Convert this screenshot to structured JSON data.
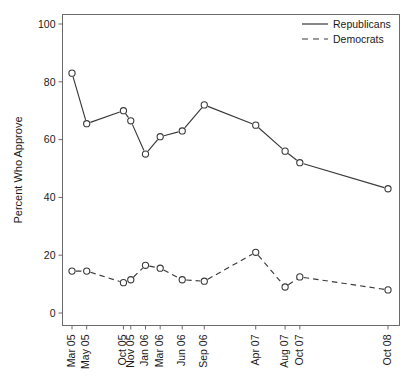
{
  "chart_data": {
    "type": "line",
    "title": "",
    "xlabel": "",
    "ylabel": "Percent Who Approve",
    "ylim": [
      0,
      100
    ],
    "yticks": [
      0,
      20,
      40,
      60,
      80,
      100
    ],
    "ytick_labels": [
      "0",
      "20",
      "40",
      "60",
      "80",
      "100"
    ],
    "grid": false,
    "legend_position": "top-right",
    "categories": [
      "Mar 05",
      "May 05",
      "Oct 05",
      "Nov 05",
      "Jan 06",
      "Mar 06",
      "Jun 06",
      "Sep 06",
      "Apr 07",
      "Aug 07",
      "Oct 07",
      "Oct 08"
    ],
    "x_positions": [
      0,
      2,
      7,
      8,
      10,
      12,
      15,
      18,
      25,
      29,
      31,
      43
    ],
    "xlim": [
      -2,
      45
    ],
    "series": [
      {
        "name": "Republicans",
        "style": "solid",
        "marker": "open-circle",
        "values": [
          83,
          65.5,
          70,
          66.5,
          55,
          61,
          63,
          72,
          65,
          56,
          52,
          43
        ]
      },
      {
        "name": "Democrats",
        "style": "dashed",
        "marker": "open-circle",
        "values": [
          14.5,
          14.5,
          10.5,
          11.5,
          16.5,
          15.5,
          11.5,
          11,
          21,
          9,
          12.5,
          8
        ]
      }
    ]
  },
  "legend": {
    "items": [
      {
        "label": "Republicans",
        "style": "solid"
      },
      {
        "label": "Democrats",
        "style": "dashed"
      }
    ]
  },
  "axes": {
    "y_label": "Percent Who Approve"
  }
}
